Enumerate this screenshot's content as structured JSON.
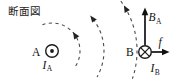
{
  "figure": {
    "caption": "断面図",
    "wires": {
      "a": {
        "point_label": "A",
        "current": {
          "symbol": "I",
          "subscript": "A"
        },
        "direction": "current-out-of-page"
      },
      "b": {
        "point_label": "B",
        "current": {
          "symbol": "I",
          "subscript": "B"
        },
        "direction": "current-into-page"
      }
    },
    "vectors": {
      "field": {
        "symbol": "B",
        "subscript": "A"
      },
      "force": {
        "symbol": "f"
      }
    },
    "field_lines": {
      "style": "dashed",
      "rotation": "counterclockwise",
      "centered_on": "A",
      "count": 3
    },
    "colors": {
      "ink": "#1a1a1a",
      "field_line": "#4a4a4a",
      "background": "#ffffff"
    }
  }
}
